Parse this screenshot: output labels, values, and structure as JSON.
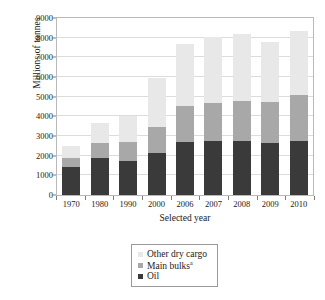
{
  "chart_data": {
    "type": "bar",
    "subtype": "stacked-vertical",
    "title": "",
    "xlabel": "Selected year",
    "ylabel": "Millions of tonnes",
    "categories": [
      "1970",
      "1980",
      "1990",
      "2000",
      "2006",
      "2007",
      "2008",
      "2009",
      "2010"
    ],
    "ylim": [
      0,
      9000
    ],
    "yticks": [
      0,
      1000,
      2000,
      3000,
      4000,
      5000,
      6000,
      7000,
      8000,
      9000
    ],
    "ytick_labels": [
      "0",
      "1000",
      "2000",
      "3000",
      "4000",
      "5000",
      "6000",
      "7000",
      "8000",
      "9000"
    ],
    "grid": true,
    "legend_position": "below-plot",
    "stack_order_bottom_to_top": [
      "Oil",
      "Main bulks",
      "Other dry cargo"
    ],
    "series": [
      {
        "name": "Oil",
        "label": "Oil",
        "color": "#3a3a3a",
        "values": [
          1440,
          1870,
          1750,
          2160,
          2700,
          2750,
          2740,
          2650,
          2750
        ]
      },
      {
        "name": "Main bulks",
        "label": "Main bulks",
        "label_superscript": "a",
        "color": "#a8a8a8",
        "values": [
          450,
          750,
          950,
          1280,
          1830,
          1950,
          2050,
          2090,
          2350
        ]
      },
      {
        "name": "Other dry cargo",
        "label": "Other dry cargo",
        "color": "#e8e8e8",
        "values": [
          620,
          1030,
          1300,
          2530,
          3150,
          3320,
          3390,
          3060,
          3230
        ]
      }
    ],
    "totals": [
      2510,
      3650,
      4000,
      5970,
      7680,
      8020,
      8180,
      7800,
      8330
    ]
  },
  "legend": {
    "entries": [
      {
        "label": "Other dry cargo",
        "sup": "",
        "color": "#e8e8e8"
      },
      {
        "label": "Main bulks",
        "sup": "a",
        "color": "#a8a8a8"
      },
      {
        "label": "Oil",
        "sup": "",
        "color": "#3a3a3a"
      }
    ]
  },
  "axes": {
    "y_title": "Millions of tonnes",
    "x_title": "Selected year"
  }
}
